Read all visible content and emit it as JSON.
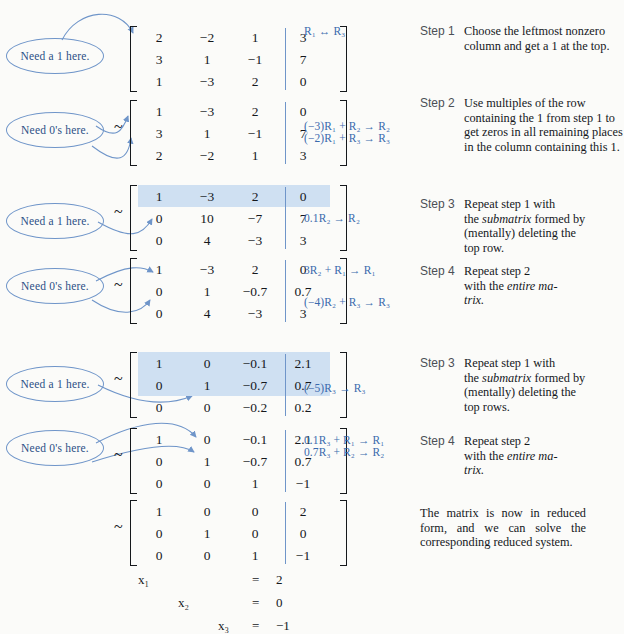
{
  "colors": {
    "accent_blue": "#3a6aad",
    "bubble_blue": "#6f95c9",
    "highlight": "#cfe0f2",
    "step_label": "#4b4f56",
    "text": "#15181c",
    "page_bg": "#fbfbf9"
  },
  "bubbles": [
    {
      "id": "b1",
      "label": "Need a 1 here."
    },
    {
      "id": "b2",
      "label": "Need 0's here."
    },
    {
      "id": "b3",
      "label": "Need a 1 here."
    },
    {
      "id": "b4",
      "label": "Need 0's here."
    },
    {
      "id": "b5",
      "label": "Need a 1 here."
    },
    {
      "id": "b6",
      "label": "Need 0's here."
    }
  ],
  "tilde": "~",
  "matrices": [
    {
      "id": "m1",
      "tilde": false,
      "highlight_rows": [],
      "rows": [
        [
          "2",
          "−2",
          "1",
          "3"
        ],
        [
          "3",
          "1",
          "−1",
          "7"
        ],
        [
          "1",
          "−3",
          "2",
          "0"
        ]
      ]
    },
    {
      "id": "m2",
      "tilde": true,
      "highlight_rows": [],
      "rows": [
        [
          "1",
          "−3",
          "2",
          "0"
        ],
        [
          "3",
          "1",
          "−1",
          "7"
        ],
        [
          "2",
          "−2",
          "1",
          "3"
        ]
      ]
    },
    {
      "id": "m3",
      "tilde": true,
      "highlight_rows": [
        0
      ],
      "rows": [
        [
          "1",
          "−3",
          "2",
          "0"
        ],
        [
          "0",
          "10",
          "−7",
          "7"
        ],
        [
          "0",
          "4",
          "−3",
          "3"
        ]
      ]
    },
    {
      "id": "m4",
      "tilde": true,
      "highlight_rows": [],
      "rows": [
        [
          "1",
          "−3",
          "2",
          "0"
        ],
        [
          "0",
          "1",
          "−0.7",
          "0.7"
        ],
        [
          "0",
          "4",
          "−3",
          "3"
        ]
      ]
    },
    {
      "id": "m5",
      "tilde": true,
      "highlight_rows": [
        0,
        1
      ],
      "rows": [
        [
          "1",
          "0",
          "−0.1",
          "2.1"
        ],
        [
          "0",
          "1",
          "−0.7",
          "0.7"
        ],
        [
          "0",
          "0",
          "−0.2",
          "0.2"
        ]
      ]
    },
    {
      "id": "m6",
      "tilde": true,
      "highlight_rows": [],
      "rows": [
        [
          "1",
          "0",
          "−0.1",
          "2.1"
        ],
        [
          "0",
          "1",
          "−0.7",
          "0.7"
        ],
        [
          "0",
          "0",
          "1",
          "−1"
        ]
      ]
    },
    {
      "id": "m7",
      "tilde": true,
      "highlight_rows": [],
      "rows": [
        [
          "1",
          "0",
          "0",
          "2"
        ],
        [
          "0",
          "1",
          "0",
          "0"
        ],
        [
          "0",
          "0",
          "1",
          "−1"
        ]
      ]
    }
  ],
  "row_operations": [
    {
      "id": "op1",
      "lines": [
        "R₁ ↔ R₃"
      ]
    },
    {
      "id": "op2",
      "lines": [
        "(−3)R₁ + R₂ → R₂",
        "(−2)R₁ + R₃ → R₃"
      ]
    },
    {
      "id": "op3",
      "lines": [
        "0.1R₂ → R₂"
      ]
    },
    {
      "id": "op4",
      "lines": [
        "3R₂ + R₁ → R₁",
        "(−4)R₂ + R₃ → R₃"
      ]
    },
    {
      "id": "op5",
      "lines": [
        "(−5)R₃ → R₃"
      ]
    },
    {
      "id": "op6",
      "lines": [
        "0.1R₃ + R₁ → R₁",
        "0.7R₃ + R₂ → R₂"
      ]
    }
  ],
  "steps": [
    {
      "id": "s1",
      "label": "Step 1",
      "text": "Choose the leftmost nonzero column and get a 1 at the top."
    },
    {
      "id": "s2",
      "label": "Step 2",
      "text": "Use multiples of the row containing the 1 from step 1 to get zeros in all remaining places in the column containing this 1."
    },
    {
      "id": "s3",
      "label": "Step 3",
      "text": "Repeat step 1 with the submatrix formed by (mentally) deleting the top row."
    },
    {
      "id": "s4",
      "label": "Step 4",
      "text": "Repeat step 2 with the entire matrix."
    },
    {
      "id": "s5",
      "label": "Step 3",
      "text": "Repeat step 1 with the submatrix formed by (mentally) deleting the top rows."
    },
    {
      "id": "s6",
      "label": "Step 4",
      "text": "Repeat step 2 with the entire matrix."
    }
  ],
  "closing_note": "The matrix is now in reduced form, and we can solve the corresponding reduced system.",
  "solution_system": {
    "equals": "=",
    "rows": [
      {
        "var": "x₁",
        "col": 0,
        "value": "2"
      },
      {
        "var": "x₂",
        "col": 1,
        "value": "0"
      },
      {
        "var": "x₃",
        "col": 2,
        "value": "−1"
      }
    ]
  }
}
